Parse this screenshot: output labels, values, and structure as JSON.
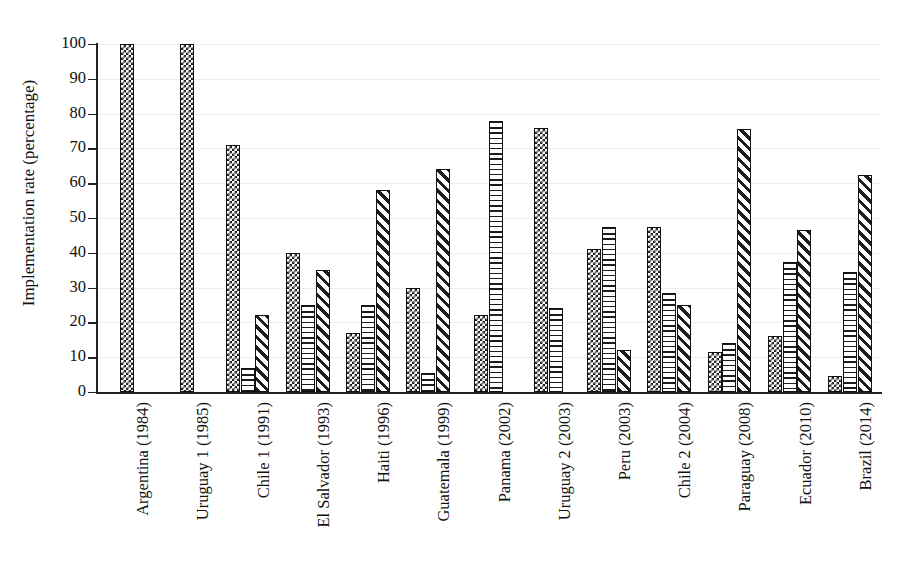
{
  "chart_data": {
    "type": "bar",
    "title": "",
    "xlabel": "",
    "ylabel": "Implementation rate (percentage)",
    "ylim": [
      0,
      100
    ],
    "yticks": [
      0,
      10,
      20,
      30,
      40,
      50,
      60,
      70,
      80,
      90,
      100
    ],
    "grid": true,
    "legend": "none",
    "categories": [
      "Argentina (1984)",
      "Uruguay 1 (1985)",
      "Chile 1 (1991)",
      "El Salvador (1993)",
      "Haiti (1996)",
      "Guatemala (1999)",
      "Panama (2002)",
      "Uruguay 2 (2003)",
      "Peru (2003)",
      "Chile 2 (2004)",
      "Paraguay (2008)",
      "Ecuador (2010)",
      "Brazil (2014)"
    ],
    "series": [
      {
        "name": "series-1",
        "pattern": "checker",
        "values": [
          100,
          100,
          71,
          40,
          17,
          30,
          22,
          76,
          41,
          47.5,
          11.5,
          16,
          4.5
        ]
      },
      {
        "name": "series-2",
        "pattern": "horizontal-lines",
        "values": [
          null,
          null,
          7,
          25,
          25,
          5.5,
          78,
          24,
          47.5,
          28.5,
          14,
          37.5,
          34.5
        ]
      },
      {
        "name": "series-3",
        "pattern": "diagonal-stripes",
        "values": [
          null,
          null,
          22,
          35,
          58,
          64,
          null,
          null,
          12,
          25,
          75.5,
          46.5,
          62.5
        ]
      }
    ],
    "colors": {
      "axis": "#222222",
      "grid": "#ededed",
      "bar_outline": "#111111",
      "bar_fill": "#1d1d1d",
      "background": "#ffffff"
    }
  }
}
